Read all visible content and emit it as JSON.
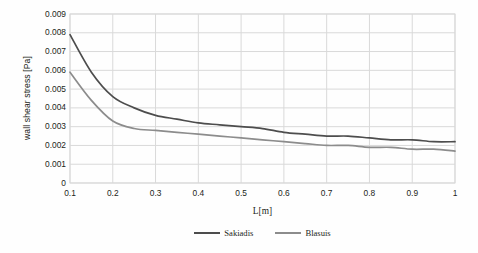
{
  "chart_data": {
    "type": "line",
    "title": "",
    "xlabel": "L[m]",
    "ylabel": "wall shear stress [Pa]",
    "xlim": [
      0.1,
      1.0
    ],
    "ylim": [
      0,
      0.009
    ],
    "grid": true,
    "legend_position": "bottom",
    "xticks": [
      "0.1",
      "0.2",
      "0.3",
      "0.4",
      "0.5",
      "0.6",
      "0.7",
      "0.8",
      "0.9",
      "1"
    ],
    "yticks": [
      "0.009",
      "0.008",
      "0.007",
      "0.006",
      "0.005",
      "0.004",
      "0.003",
      "0.002",
      "0.001",
      "0"
    ],
    "x": [
      0.1,
      0.15,
      0.2,
      0.25,
      0.3,
      0.35,
      0.4,
      0.45,
      0.5,
      0.55,
      0.6,
      0.65,
      0.7,
      0.75,
      0.8,
      0.85,
      0.9,
      0.95,
      1.0
    ],
    "series": [
      {
        "name": "Sakiadis",
        "color": "#4d4d4d",
        "values": [
          0.0079,
          0.0059,
          0.0046,
          0.004,
          0.0036,
          0.0034,
          0.0032,
          0.0031,
          0.003,
          0.0029,
          0.0027,
          0.0026,
          0.0025,
          0.0025,
          0.0024,
          0.0023,
          0.0023,
          0.0022,
          0.0022
        ]
      },
      {
        "name": "Blasuis",
        "color": "#8c8c8c",
        "values": [
          0.0059,
          0.0044,
          0.0033,
          0.0029,
          0.0028,
          0.0027,
          0.0026,
          0.0025,
          0.0024,
          0.0023,
          0.0022,
          0.0021,
          0.002,
          0.002,
          0.0019,
          0.0019,
          0.0018,
          0.0018,
          0.0017
        ]
      }
    ]
  },
  "legend": {
    "items": [
      {
        "label": "Sakiadis",
        "color": "#4d4d4d"
      },
      {
        "label": "Blasuis",
        "color": "#8c8c8c"
      }
    ]
  },
  "axes": {
    "plot_border_color": "#d9d9d9",
    "gridline_color": "#d9d9d9"
  }
}
